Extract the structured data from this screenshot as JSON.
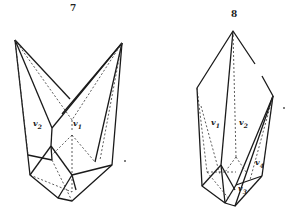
{
  "figures": [
    {
      "number": "7",
      "faces": [
        {
          "name": "v",
          "sub": "2"
        },
        {
          "name": "v",
          "sub": "1"
        }
      ]
    },
    {
      "number": "8",
      "faces": [
        {
          "name": "v",
          "sub": "1"
        },
        {
          "name": "v",
          "sub": "2"
        },
        {
          "name": "v",
          "sub": "4"
        },
        {
          "name": "v",
          "sub": "3"
        }
      ]
    }
  ]
}
